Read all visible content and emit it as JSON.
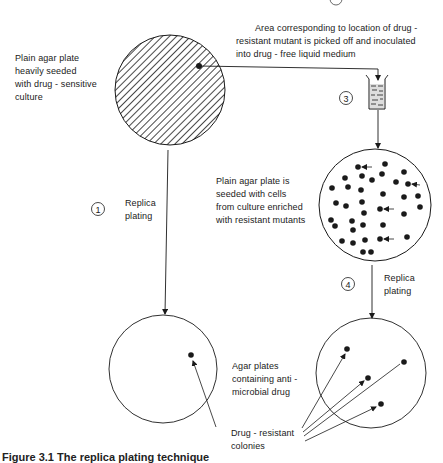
{
  "labels": {
    "top_plate": [
      "Plain agar plate",
      "heavily seeded",
      "with drug - sensitive",
      "culture"
    ],
    "pick_off": [
      "Area corresponding to location of drug -",
      "resistant mutant is picked off and inoculated",
      "into drug - free liquid medium"
    ],
    "seeded_plate": [
      "Plain agar plate is",
      "seeded with cells",
      "from culture enriched",
      "with resistant mutants"
    ],
    "replica_1": [
      "Replica",
      "plating"
    ],
    "replica_4": [
      "Replica",
      "plating"
    ],
    "agar_plates": [
      "Agar plates",
      "containing anti -",
      "microbial drug"
    ],
    "colonies": [
      "Drug - resistant",
      "colonies"
    ]
  },
  "steps": {
    "step1": "1",
    "step2": "2",
    "step3": "3",
    "step4": "4"
  },
  "caption": "Figure 3.1  The replica plating technique",
  "colors": {
    "ink": "#1a1a1a",
    "background": "#ffffff"
  },
  "plates": {
    "top_plate": {
      "cx": 170,
      "cy": 90,
      "r": 55,
      "fill": "hatched"
    },
    "seeded_plate": {
      "cx": 375,
      "cy": 205,
      "r": 56,
      "colony_count": 35,
      "arrowed_colonies": 4
    },
    "bottom_left_plate": {
      "cx": 163,
      "cy": 369,
      "r": 54,
      "colony_count": 1
    },
    "bottom_right_plate": {
      "cx": 371,
      "cy": 373,
      "r": 55,
      "colony_count": 4
    }
  }
}
